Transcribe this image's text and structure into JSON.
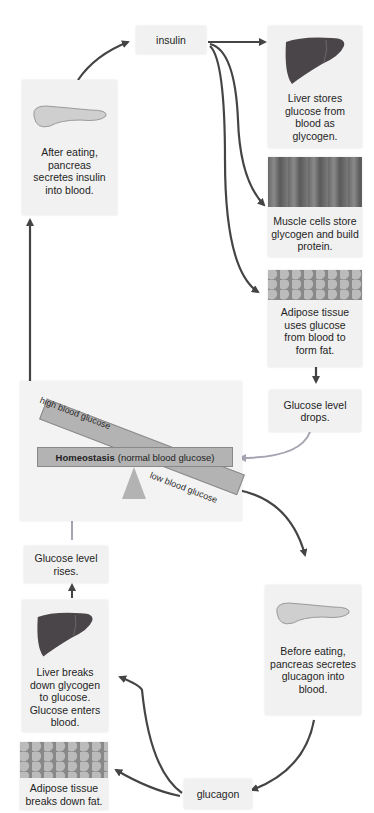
{
  "labels": {
    "insulin": "insulin",
    "glucagon": "glucagon",
    "pancreas_after": "After eating, pancreas secretes insulin into blood.",
    "liver_stores": "Liver stores glucose from blood as glycogen.",
    "muscle": "Muscle cells store glycogen and build protein.",
    "adipose_uses": "Adipose tissue uses glucose from blood to form fat.",
    "glucose_drops": "Glucose level drops.",
    "homeostasis_bold": "Homeostasis",
    "homeostasis_rest": "(normal blood glucose)",
    "high": "high blood glucose",
    "low": "low blood glucose",
    "glucose_rises": "Glucose level rises.",
    "pancreas_before": "Before eating, pancreas secretes glucagon into blood.",
    "liver_breaks": "Liver breaks down glycogen to glucose. Glucose enters blood.",
    "adipose_breaks": "Adipose tissue breaks down fat."
  },
  "colors": {
    "arrow_dark": "#444444",
    "arrow_light": "#a6a4b2",
    "box_bg": "#f1f1f1",
    "bar": "#b3b3b3",
    "liver": "#4a4548",
    "pancreas": "#cfcfcf"
  }
}
